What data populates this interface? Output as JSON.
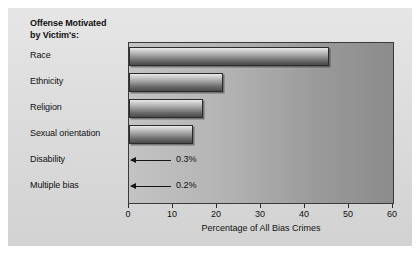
{
  "figure": {
    "header_line1": "Offense Motivated",
    "header_line2": "by Victim's:"
  },
  "chart_data": {
    "type": "bar",
    "orientation": "horizontal",
    "title": "",
    "xlabel": "Percentage of All Bias Crimes",
    "ylabel": "",
    "xlim": [
      0,
      60
    ],
    "xticks": [
      0,
      10,
      20,
      30,
      40,
      50,
      60
    ],
    "xticklabels": [
      "0",
      "10",
      "20",
      "30",
      "40",
      "50",
      "60"
    ],
    "grid": false,
    "legend": null,
    "categories": [
      "Race",
      "Ethnicity",
      "Religion",
      "Sexual orientation",
      "Disability",
      "Multiple bias"
    ],
    "values": [
      45.5,
      21.4,
      16.8,
      14.5,
      0.3,
      0.2
    ],
    "annotations": [
      {
        "category": "Disability",
        "label": "0.3%"
      },
      {
        "category": "Multiple bias",
        "label": "0.2%"
      }
    ],
    "colors": {
      "bar_light": "#e9e9e9",
      "bar_dark": "#4a4a4a",
      "plot_background_left": "#c3c3c3",
      "plot_background_right": "#8b8b8b",
      "figure_background": "#dcdcdc",
      "axis": "#2c2c2c",
      "text": "#111111"
    }
  }
}
